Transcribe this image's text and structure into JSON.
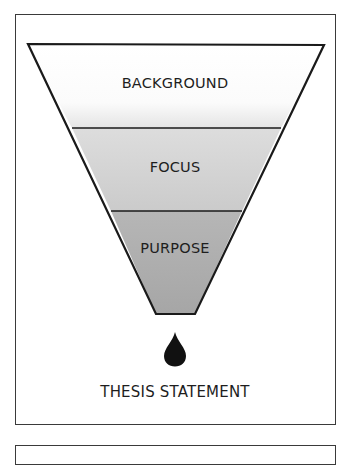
{
  "diagram": {
    "type": "funnel",
    "layers": [
      {
        "label": "BACKGROUND",
        "fill_top": "#ffffff",
        "fill_bottom": "#e6e6e6"
      },
      {
        "label": "FOCUS",
        "fill_top": "#dcdcdc",
        "fill_bottom": "#cdcdcd"
      },
      {
        "label": "PURPOSE",
        "fill_top": "#b4b4b4",
        "fill_bottom": "#a8a8a8"
      }
    ],
    "output": {
      "icon": "drop-icon",
      "label": "THESIS STATEMENT"
    },
    "colors": {
      "stroke": "#1a1a1a",
      "drop": "#111111",
      "frame": "#3a3a3a"
    }
  }
}
